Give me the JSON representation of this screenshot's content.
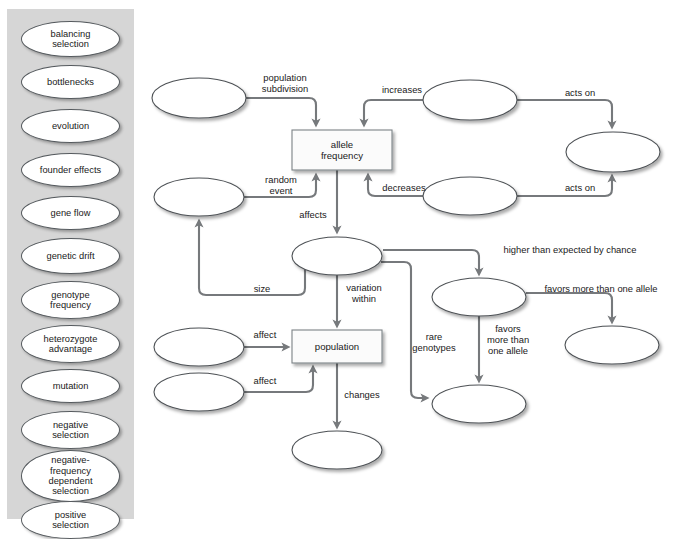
{
  "colors": {
    "bank_background": "#d6d6d6",
    "node_fill": "#ffffff",
    "node_stroke": "#4d5155",
    "edge_stroke": "#76797c",
    "box_stroke": "#7d8387",
    "text": "#1a1a1a"
  },
  "word_bank": {
    "name": "term-bank",
    "items": [
      {
        "label": "balancing\nselection",
        "lines": [
          "balancing",
          "selection"
        ]
      },
      {
        "label": "bottlenecks",
        "lines": [
          "bottlenecks"
        ]
      },
      {
        "label": "evolution",
        "lines": [
          "evolution"
        ]
      },
      {
        "label": "founder effects",
        "lines": [
          "founder effects"
        ]
      },
      {
        "label": "gene flow",
        "lines": [
          "gene flow"
        ]
      },
      {
        "label": "genetic drift",
        "lines": [
          "genetic drift"
        ]
      },
      {
        "label": "genotype frequency",
        "lines": [
          "genotype",
          "frequency"
        ]
      },
      {
        "label": "heterozygote advantage",
        "lines": [
          "heterozygote",
          "advantage"
        ]
      },
      {
        "label": "mutation",
        "lines": [
          "mutation"
        ]
      },
      {
        "label": "negative selection",
        "lines": [
          "negative",
          "selection"
        ]
      },
      {
        "label": "negative-frequency dependent selection",
        "lines": [
          "negative-",
          "frequency",
          "dependent",
          "selection"
        ]
      },
      {
        "label": "positive selection",
        "lines": [
          "positive",
          "selection"
        ]
      }
    ]
  },
  "diagram": {
    "nodes": [
      {
        "id": "n_topleft",
        "type": "ellipse",
        "label": "",
        "cx": 199,
        "cy": 98,
        "rx": 47,
        "ry": 20
      },
      {
        "id": "n_topmid",
        "type": "ellipse",
        "label": "",
        "cx": 470,
        "cy": 100,
        "rx": 47,
        "ry": 20
      },
      {
        "id": "n_topright",
        "type": "ellipse",
        "label": "",
        "cx": 613,
        "cy": 152,
        "rx": 47,
        "ry": 20
      },
      {
        "id": "n_allelefreq",
        "type": "rect",
        "label": "allele frequency",
        "lines": [
          "allele",
          "frequency"
        ],
        "x": 292,
        "y": 130,
        "w": 100,
        "h": 40
      },
      {
        "id": "n_midleft",
        "type": "ellipse",
        "label": "",
        "cx": 199,
        "cy": 197,
        "rx": 45,
        "ry": 19
      },
      {
        "id": "n_midright",
        "type": "ellipse",
        "label": "",
        "cx": 470,
        "cy": 196,
        "rx": 47,
        "ry": 19
      },
      {
        "id": "n_center",
        "type": "ellipse",
        "label": "",
        "cx": 337,
        "cy": 256,
        "rx": 45,
        "ry": 19
      },
      {
        "id": "n_rightmid",
        "type": "ellipse",
        "label": "",
        "cx": 479,
        "cy": 297,
        "rx": 47,
        "ry": 19
      },
      {
        "id": "n_farright",
        "type": "ellipse",
        "label": "",
        "cx": 612,
        "cy": 345,
        "rx": 47,
        "ry": 19
      },
      {
        "id": "n_lowleft1",
        "type": "ellipse",
        "label": "",
        "cx": 199,
        "cy": 347,
        "rx": 45,
        "ry": 19
      },
      {
        "id": "n_lowleft2",
        "type": "ellipse",
        "label": "",
        "cx": 199,
        "cy": 392,
        "rx": 45,
        "ry": 19
      },
      {
        "id": "n_population",
        "type": "rect",
        "label": "population",
        "lines": [
          "population"
        ],
        "x": 292,
        "y": 330,
        "w": 90,
        "h": 33
      },
      {
        "id": "n_lowright",
        "type": "ellipse",
        "label": "",
        "cx": 479,
        "cy": 404,
        "rx": 47,
        "ry": 19
      },
      {
        "id": "n_bottom",
        "type": "ellipse",
        "label": "",
        "cx": 337,
        "cy": 450,
        "rx": 45,
        "ry": 19
      }
    ],
    "edges": [
      {
        "id": "e_population_subdivision",
        "label": "population subdivision",
        "lines": [
          "population",
          "subdivision"
        ],
        "from": "n_topleft",
        "to": "n_allelefreq",
        "label_x": 285,
        "label_y": 81
      },
      {
        "id": "e_increases",
        "label": "increases",
        "lines": [
          "increases"
        ],
        "from": "n_topmid",
        "to": "n_allelefreq",
        "label_x": 402,
        "label_y": 93
      },
      {
        "id": "e_acts_on_top",
        "label": "acts on",
        "lines": [
          "acts on"
        ],
        "from": "n_topmid",
        "to": "n_topright",
        "label_x": 580,
        "label_y": 96
      },
      {
        "id": "e_random_event",
        "label": "random event",
        "lines": [
          "random",
          "event"
        ],
        "from": "n_midleft",
        "to": "n_allelefreq",
        "label_x": 281,
        "label_y": 183
      },
      {
        "id": "e_decreases",
        "label": "decreases",
        "lines": [
          "decreases"
        ],
        "from": "n_midright",
        "to": "n_allelefreq",
        "label_x": 404,
        "label_y": 191
      },
      {
        "id": "e_acts_on_bottom",
        "label": "acts on",
        "lines": [
          "acts on"
        ],
        "from": "n_midright",
        "to": "n_topright",
        "label_x": 580,
        "label_y": 191
      },
      {
        "id": "e_affects",
        "label": "affects",
        "lines": [
          "affects"
        ],
        "from": "n_allelefreq",
        "to": "n_center",
        "label_x": 313,
        "label_y": 218
      },
      {
        "id": "e_size",
        "label": "size",
        "lines": [
          "size"
        ],
        "from": "n_center",
        "to": "n_midleft",
        "label_x": 262,
        "label_y": 292
      },
      {
        "id": "e_variation_within",
        "label": "variation within",
        "lines": [
          "variation",
          "within"
        ],
        "from": "n_center",
        "to": "n_population",
        "label_x": 364,
        "label_y": 291
      },
      {
        "id": "e_rare_genotypes",
        "label": "rare genotypes",
        "lines": [
          "rare",
          "genotypes"
        ],
        "from": "n_center",
        "to": "n_lowright",
        "label_x": 434,
        "label_y": 340
      },
      {
        "id": "e_higher_than_expected",
        "label": "higher than expected by chance",
        "lines": [
          "higher than expected by chance"
        ],
        "from": "n_center",
        "to": "n_rightmid",
        "label_x": 570,
        "label_y": 253
      },
      {
        "id": "e_favors_more_vertical",
        "label": "favors more than one allele",
        "lines": [
          "favors",
          "more than",
          "one allele"
        ],
        "from": "n_rightmid",
        "to": "n_lowright",
        "label_x": 508,
        "label_y": 332
      },
      {
        "id": "e_favors_more_horizontal",
        "label": "favors more than one allele",
        "lines": [
          "favors more than one allele"
        ],
        "from": "n_rightmid",
        "to": "n_farright",
        "label_x": 601,
        "label_y": 292
      },
      {
        "id": "e_affect_1",
        "label": "affect",
        "lines": [
          "affect"
        ],
        "from": "n_lowleft1",
        "to": "n_population",
        "label_x": 265,
        "label_y": 338
      },
      {
        "id": "e_affect_2",
        "label": "affect",
        "lines": [
          "affect"
        ],
        "from": "n_lowleft2",
        "to": "n_population",
        "label_x": 265,
        "label_y": 384
      },
      {
        "id": "e_changes",
        "label": "changes",
        "lines": [
          "changes"
        ],
        "from": "n_population",
        "to": "n_bottom",
        "label_x": 362,
        "label_y": 398
      }
    ]
  }
}
